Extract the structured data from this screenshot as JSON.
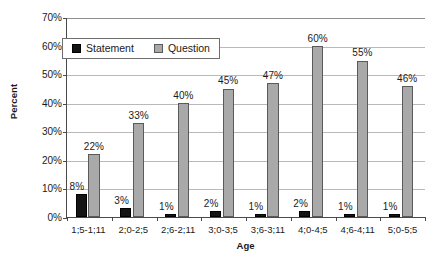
{
  "chart_data": {
    "type": "bar",
    "title": "",
    "xlabel": "Age",
    "ylabel": "Percent",
    "ylim": [
      0,
      70
    ],
    "ytick_step": 10,
    "grid": true,
    "legend_position": "top-left-inside",
    "categories": [
      "1;5-1;11",
      "2;0-2;5",
      "2;6-2;11",
      "3;0-3;5",
      "3;6-3;11",
      "4;0-4;5",
      "4;6-4;11",
      "5;0-5;5"
    ],
    "series": [
      {
        "name": "Statement",
        "color": "#141414",
        "values": [
          8,
          3,
          1,
          2,
          1,
          2,
          1,
          1
        ],
        "labels": [
          "8%",
          "3%",
          "1%",
          "2%",
          "1%",
          "2%",
          "1%",
          "1%"
        ]
      },
      {
        "name": "Question",
        "color": "#a9a9a9",
        "values": [
          22,
          33,
          40,
          45,
          47,
          60,
          55,
          46
        ],
        "labels": [
          "22%",
          "33%",
          "40%",
          "45%",
          "47%",
          "60%",
          "55%",
          "46%"
        ]
      }
    ],
    "yticks": [
      {
        "value": 70,
        "label": "70%"
      },
      {
        "value": 60,
        "label": "60%"
      },
      {
        "value": 50,
        "label": "50%"
      },
      {
        "value": 40,
        "label": "40%"
      },
      {
        "value": 30,
        "label": "30%"
      },
      {
        "value": 20,
        "label": "20%"
      },
      {
        "value": 10,
        "label": "10%"
      },
      {
        "value": 0,
        "label": "0%"
      }
    ]
  }
}
